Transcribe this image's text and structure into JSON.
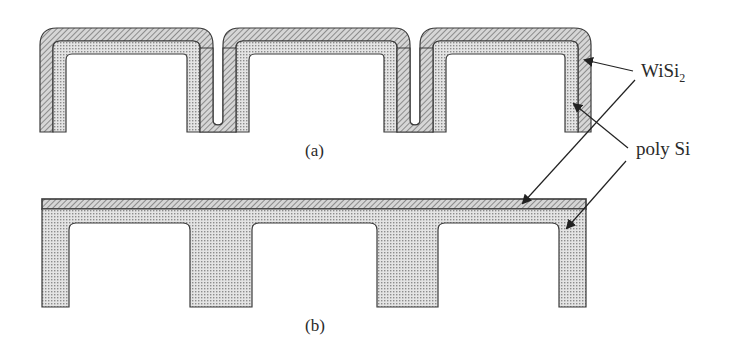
{
  "figure": {
    "panels": [
      {
        "id": "a",
        "caption": "(a)",
        "description": "Conformal WiSi2 over poly Si deposited on trenched structure"
      },
      {
        "id": "b",
        "caption": "(b)",
        "description": "Planarized poly Si filling trenches with flat WiSi2 layer on top"
      }
    ],
    "labels": {
      "wisi2_main": "WiSi",
      "wisi2_sub": "2",
      "poly_si": "poly Si"
    },
    "legend_layers": [
      {
        "name": "WiSi2",
        "pattern": "diagonal-hatch",
        "color": "#9a9a9a"
      },
      {
        "name": "poly Si",
        "pattern": "dot-grid",
        "color": "#c8c8c8"
      }
    ],
    "colors": {
      "outline": "#3a3a3a",
      "arrow": "#222222",
      "background": "#ffffff"
    }
  }
}
